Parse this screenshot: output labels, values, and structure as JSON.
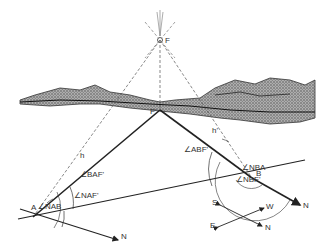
{
  "diagram": {
    "points": {
      "F": "F",
      "F_prime": "F'",
      "A": "A",
      "B": "B"
    },
    "angles": {
      "BAF": "∠BAF'",
      "NAF": "∠NAF'",
      "NAB": "∠NAB",
      "ABF": "∠ABF'",
      "NBA": "∠NBA",
      "NBF": "∠NBF'"
    },
    "heights": {
      "h": "h",
      "h_prime": "h'"
    },
    "north_labels": {
      "from_A": "N",
      "from_B": "N"
    },
    "compass": {
      "S": "S",
      "W": "W",
      "E": "E",
      "N": "N"
    },
    "colors": {
      "line": "#222222",
      "dashed": "#555555",
      "terrain": "#8a8a8a"
    }
  }
}
